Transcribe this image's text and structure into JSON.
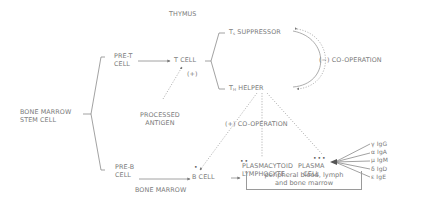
{
  "diagram": {
    "regions": {
      "thymus": "THYMUS",
      "bone_marrow": "BONE MARROW"
    },
    "nodes": {
      "stem_cell": [
        "BONE MARROW",
        "STEM CELL"
      ],
      "pre_t": [
        "PRE-T",
        "CELL"
      ],
      "pre_b": [
        "PRE-B",
        "CELL"
      ],
      "t_cell": "T CELL",
      "t_suppressor": {
        "prefix": "T",
        "subscript": "s",
        "label": "SUPPRESSOR"
      },
      "t_helper": {
        "prefix": "T",
        "subscript": "H",
        "label": "HELPER"
      },
      "processed_antigen": [
        "PROCESSED",
        "ANTIGEN"
      ],
      "b_cell": "B CELL",
      "plasmacytoid": [
        "PLASMACYTOID",
        "LYMPHOCYTE"
      ],
      "plasma_cell": [
        "PLASMA",
        "CELL"
      ],
      "location_note": [
        "peripheral blood, lymph",
        "and bone marrow"
      ]
    },
    "annotations": {
      "plus_sign": "(+)",
      "neg_cooperation": "(−) CO-OPERATION",
      "pos_cooperation": "(+) CO-OPERATION",
      "b_cell_dots": "•",
      "plasmacytoid_dots": "••",
      "plasma_dots": "•••"
    },
    "immunoglobulins": [
      {
        "greek": "γ",
        "label": "IgG"
      },
      {
        "greek": "α",
        "label": "IgA"
      },
      {
        "greek": "μ",
        "label": "IgM"
      },
      {
        "greek": "δ",
        "label": "IgD"
      },
      {
        "greek": "ε",
        "label": "IgE"
      }
    ],
    "colors": {
      "text": "#7a7a7a",
      "line": "#8a8a8a",
      "background": "#ffffff"
    }
  }
}
